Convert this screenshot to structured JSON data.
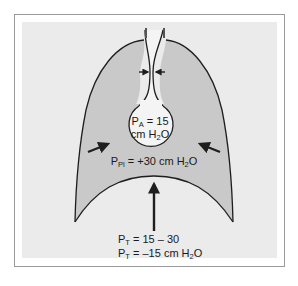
{
  "figure": {
    "colors": {
      "frame_border": "#9a9a9a",
      "panel_background": "#ebebeb",
      "lung_fill": "#c9c9c9",
      "outline": "#1e1e1e",
      "alveolus_fill": "#f4f4f4"
    },
    "alveolar_pressure": {
      "symbol": "P",
      "subscript": "A",
      "value_line1": " = 15",
      "value_line2_prefix": "cm H",
      "value_line2_sub": "2",
      "value_line2_suffix": "O"
    },
    "pleural_pressure": {
      "symbol": "P",
      "subscript": "Pl",
      "value_prefix": " = +30 cm H",
      "value_sub": "2",
      "value_suffix": "O"
    },
    "transpulmonary_pressure": {
      "line1_symbol": "P",
      "line1_subscript": "T",
      "line1_value": " = 15 – 30",
      "line2_symbol": "P",
      "line2_subscript": "T",
      "line2_value_prefix": " = –15 cm H",
      "line2_value_sub": "2",
      "line2_value_suffix": "O"
    },
    "arrows": [
      {
        "name": "airway-compression-left-arrow",
        "direction": "right"
      },
      {
        "name": "airway-compression-right-arrow",
        "direction": "left"
      },
      {
        "name": "chest-wall-left-arrow",
        "direction": "inward"
      },
      {
        "name": "chest-wall-right-arrow",
        "direction": "inward"
      },
      {
        "name": "diaphragm-up-arrow",
        "direction": "up"
      }
    ]
  }
}
